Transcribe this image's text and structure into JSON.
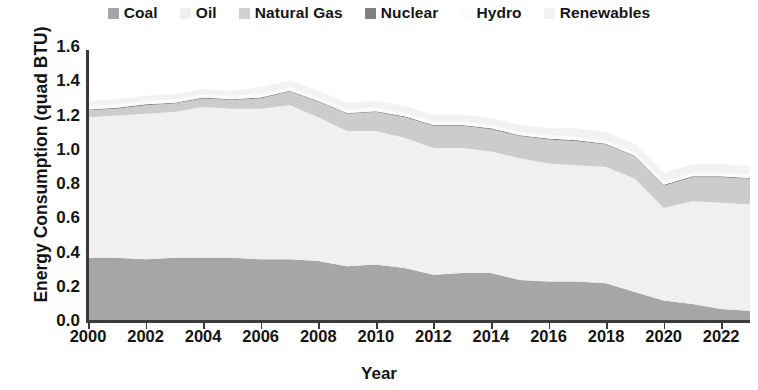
{
  "chart_data": {
    "type": "area",
    "stacked": true,
    "title": "",
    "xlabel": "Year",
    "ylabel": "Energy Consumption (quad BTU)",
    "ylim": [
      0.0,
      1.6
    ],
    "ytick_labels": [
      "0.0",
      "0.2",
      "0.4",
      "0.6",
      "0.8",
      "1.0",
      "1.2",
      "1.4",
      "1.6"
    ],
    "ytick_values": [
      0.0,
      0.2,
      0.4,
      0.6,
      0.8,
      1.0,
      1.2,
      1.4,
      1.6
    ],
    "xlim": [
      2000,
      2023
    ],
    "xtick_labels": [
      "2000",
      "2002",
      "2004",
      "2006",
      "2008",
      "2010",
      "2012",
      "2014",
      "2016",
      "2018",
      "2020",
      "2022"
    ],
    "xtick_values": [
      2000,
      2002,
      2004,
      2006,
      2008,
      2010,
      2012,
      2014,
      2016,
      2018,
      2020,
      2022
    ],
    "grid": false,
    "legend_position": "top",
    "x": [
      2000,
      2001,
      2002,
      2003,
      2004,
      2005,
      2006,
      2007,
      2008,
      2009,
      2010,
      2011,
      2012,
      2013,
      2014,
      2015,
      2016,
      2017,
      2018,
      2019,
      2020,
      2021,
      2022,
      2023
    ],
    "series": [
      {
        "name": "Coal",
        "color": "#a6a6a6",
        "values": [
          0.37,
          0.37,
          0.36,
          0.37,
          0.37,
          0.37,
          0.36,
          0.36,
          0.35,
          0.32,
          0.33,
          0.31,
          0.27,
          0.28,
          0.28,
          0.24,
          0.23,
          0.23,
          0.22,
          0.17,
          0.12,
          0.1,
          0.07,
          0.06
        ]
      },
      {
        "name": "Oil",
        "color": "#f0f0f0",
        "values": [
          0.82,
          0.83,
          0.85,
          0.85,
          0.88,
          0.87,
          0.88,
          0.9,
          0.84,
          0.79,
          0.78,
          0.76,
          0.74,
          0.73,
          0.71,
          0.71,
          0.69,
          0.68,
          0.68,
          0.66,
          0.54,
          0.6,
          0.62,
          0.62
        ]
      },
      {
        "name": "Natural Gas",
        "color": "#cccccc",
        "values": [
          0.04,
          0.04,
          0.05,
          0.05,
          0.05,
          0.05,
          0.06,
          0.08,
          0.09,
          0.1,
          0.11,
          0.12,
          0.13,
          0.13,
          0.13,
          0.13,
          0.14,
          0.14,
          0.13,
          0.13,
          0.13,
          0.14,
          0.15,
          0.15
        ]
      },
      {
        "name": "Nuclear",
        "color": "#7f7f7f",
        "values": [
          0.005,
          0.005,
          0.005,
          0.005,
          0.005,
          0.005,
          0.005,
          0.005,
          0.005,
          0.005,
          0.005,
          0.005,
          0.005,
          0.005,
          0.005,
          0.005,
          0.005,
          0.005,
          0.005,
          0.005,
          0.005,
          0.005,
          0.005,
          0.005
        ]
      },
      {
        "name": "Hydro",
        "color": "#fafafa",
        "values": [
          0.02,
          0.02,
          0.02,
          0.02,
          0.02,
          0.02,
          0.02,
          0.02,
          0.02,
          0.02,
          0.02,
          0.02,
          0.02,
          0.02,
          0.02,
          0.02,
          0.02,
          0.02,
          0.02,
          0.02,
          0.02,
          0.02,
          0.02,
          0.02
        ]
      },
      {
        "name": "Renewables",
        "color": "#f2f2f2",
        "values": [
          0.03,
          0.03,
          0.03,
          0.03,
          0.03,
          0.03,
          0.04,
          0.04,
          0.04,
          0.04,
          0.04,
          0.04,
          0.04,
          0.04,
          0.04,
          0.04,
          0.04,
          0.05,
          0.05,
          0.05,
          0.05,
          0.05,
          0.05,
          0.05
        ]
      }
    ]
  },
  "legend": {
    "items": [
      {
        "label": "Coal",
        "color": "#a6a6a6"
      },
      {
        "label": "Oil",
        "color": "#f0f0f0"
      },
      {
        "label": "Natural Gas",
        "color": "#cfcfcf"
      },
      {
        "label": "Nuclear",
        "color": "#808080"
      },
      {
        "label": "Hydro",
        "color": "#fcfcfc"
      },
      {
        "label": "Renewables",
        "color": "#f2f2f2"
      }
    ]
  },
  "axes": {
    "y_title": "Energy Consumption (quad BTU)",
    "x_title": "Year"
  }
}
